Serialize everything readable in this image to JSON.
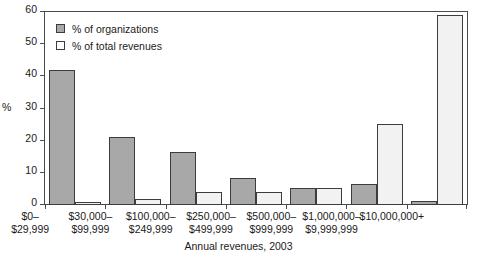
{
  "chart_data": {
    "type": "bar",
    "title": "",
    "xlabel": "Annual revenues, 2003",
    "ylabel": "%",
    "ylim": [
      0,
      60
    ],
    "yticks": [
      0,
      10,
      20,
      30,
      40,
      50,
      60
    ],
    "ytick_labels": [
      "0",
      "10",
      "20",
      "30",
      "40",
      "50",
      "60"
    ],
    "grid": false,
    "legend_position": "upper-left-inside",
    "categories": [
      "$0–\n$29,999",
      "$30,000–\n$99,999",
      "$100,000–\n$249,999",
      "$250,000–\n$499,999",
      "$500,000–\n$999,999",
      "$1,000,000–\n$9,999,999",
      "$10,000,000+"
    ],
    "category_lines": [
      {
        "line1": "$0–",
        "line2": "$29,999"
      },
      {
        "line1": "$30,000–",
        "line2": "$99,999"
      },
      {
        "line1": "$100,000–",
        "line2": "$249,999"
      },
      {
        "line1": "$250,000–",
        "line2": "$499,999"
      },
      {
        "line1": "$500,000–",
        "line2": "$999,999"
      },
      {
        "line1": "$1,000,000–",
        "line2": "$9,999,999"
      },
      {
        "line1": "$10,000,000+",
        "line2": ""
      }
    ],
    "series": [
      {
        "name": "% of organizations",
        "color": "#a8a8a8",
        "values": [
          42,
          21.2,
          16.4,
          8.4,
          5.3,
          6.6,
          1.2
        ]
      },
      {
        "name": "% of total revenues",
        "color": "#f2f2f2",
        "values": [
          1,
          2,
          4,
          4,
          5.3,
          25.2,
          59
        ]
      }
    ]
  },
  "legend": {
    "items": [
      {
        "label": "% of organizations",
        "swatch": "filled-gray-square"
      },
      {
        "label": "% of total revenues",
        "swatch": "open-white-square"
      }
    ]
  }
}
